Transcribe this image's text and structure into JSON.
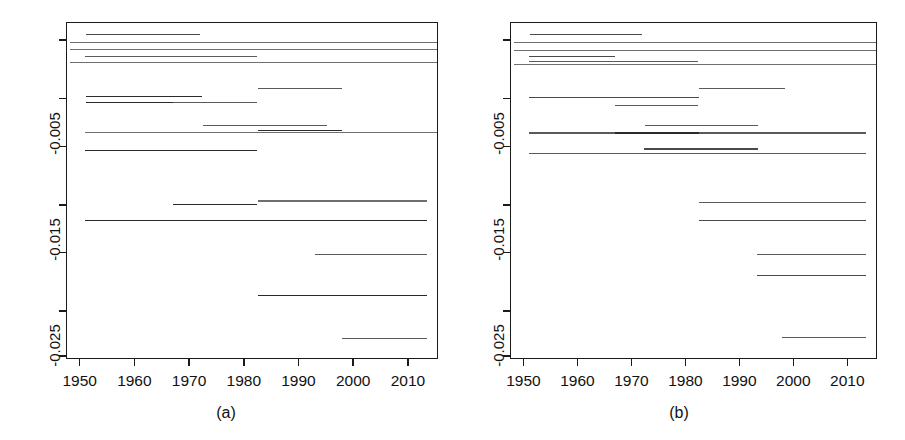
{
  "figure": {
    "width": 905,
    "height": 440,
    "background": "#ffffff",
    "line_color": "#333333",
    "axis_color": "#1a1a1a"
  },
  "panels": [
    {
      "id": "a",
      "label": "(a)",
      "plot_area": {
        "left": 66,
        "top": 22,
        "width": 372,
        "height": 337
      },
      "axes": {
        "x": {
          "min": 1947.5,
          "max": 2015.5,
          "ticks": [
            1950,
            1960,
            1970,
            1980,
            1990,
            2000,
            2010
          ],
          "ticklabels": [
            "1950",
            "1960",
            "1970",
            "1980",
            "1990",
            "2000",
            "2010"
          ]
        },
        "y": {
          "min": -0.0295,
          "max": 0.0022,
          "ticks": [
            0.0005,
            -0.005,
            -0.0095,
            -0.015,
            -0.0195,
            -0.025,
            -0.0292
          ],
          "ticklabels": [
            "",
            "-0.005",
            "",
            "-0.015",
            "",
            "-0.025",
            ""
          ],
          "labelled_ticks": [
            -0.005,
            -0.015,
            -0.025
          ]
        }
      },
      "chart_data": {
        "type": "line",
        "title": "",
        "xlabel": "",
        "ylabel": "",
        "xlim": [
          1947.5,
          2015.5
        ],
        "ylim": [
          -0.0295,
          0.0022
        ],
        "grid": false,
        "legend": "none",
        "series": [
          {
            "name": "seg1",
            "x": [
              1951.0,
              1971.8
            ],
            "y": 0.00115,
            "shade": "#4a4a4a"
          },
          {
            "name": "seg2",
            "x": [
              1948.0,
              2015.5
            ],
            "y": 0.0004,
            "shade": "#6f6f6f"
          },
          {
            "name": "seg3",
            "x": [
              1948.0,
              2015.5
            ],
            "y": -0.0003,
            "shade": "#6f6f6f"
          },
          {
            "name": "seg4",
            "x": [
              1950.8,
              1982.3
            ],
            "y": -0.00095,
            "shade": "#5a5a5a"
          },
          {
            "name": "seg5",
            "x": [
              1948.0,
              2015.5
            ],
            "y": -0.00155,
            "shade": "#6f6f6f"
          },
          {
            "name": "seg6",
            "x": [
              1982.4,
              1997.7
            ],
            "y": -0.00395,
            "shade": "#5a5a5a"
          },
          {
            "name": "seg7",
            "x": [
              1951.0,
              1972.2
            ],
            "y": -0.0047,
            "shade": "#2b2b2b"
          },
          {
            "name": "seg8",
            "x": [
              1951.0,
              1966.8
            ],
            "y": -0.0053,
            "shade": "#2b2b2b"
          },
          {
            "name": "seg9",
            "x": [
              1966.8,
              1982.2
            ],
            "y": -0.00525,
            "shade": "#5a5a5a"
          },
          {
            "name": "seg10",
            "x": [
              1972.3,
              1995.0
            ],
            "y": -0.00745,
            "shade": "#5a5a5a"
          },
          {
            "name": "seg11",
            "x": [
              1982.4,
              1997.8
            ],
            "y": -0.0079,
            "shade": "#2b2b2b"
          },
          {
            "name": "seg12",
            "x": [
              1950.8,
              2015.5
            ],
            "y": -0.0081,
            "shade": "#6f6f6f"
          },
          {
            "name": "seg13",
            "x": [
              1950.8,
              1982.3
            ],
            "y": -0.0098,
            "shade": "#2b2b2b"
          },
          {
            "name": "seg14",
            "x": [
              1966.9,
              1982.3
            ],
            "y": -0.0149,
            "shade": "#2b2b2b"
          },
          {
            "name": "seg15",
            "x": [
              1982.4,
              2013.3
            ],
            "y": -0.01455,
            "shade": "#6f6f6f"
          },
          {
            "name": "seg16",
            "x": [
              1950.8,
              2013.3
            ],
            "y": -0.0164,
            "shade": "#2b2b2b"
          },
          {
            "name": "seg17",
            "x": [
              1992.8,
              2013.3
            ],
            "y": -0.01955,
            "shade": "#5a5a5a"
          },
          {
            "name": "seg18",
            "x": [
              1982.5,
              2013.3
            ],
            "y": -0.02345,
            "shade": "#2b2b2b"
          },
          {
            "name": "seg19",
            "x": [
              1997.7,
              2013.3
            ],
            "y": -0.02745,
            "shade": "#5a5a5a"
          }
        ]
      }
    },
    {
      "id": "b",
      "label": "(b)",
      "plot_area": {
        "left": 57,
        "top": 22,
        "width": 367,
        "height": 337
      },
      "axes": {
        "x": {
          "min": 1947.5,
          "max": 2015.5,
          "ticks": [
            1950,
            1960,
            1970,
            1980,
            1990,
            2000,
            2010
          ],
          "ticklabels": [
            "1950",
            "1960",
            "1970",
            "1980",
            "1990",
            "2000",
            "2010"
          ]
        },
        "y": {
          "min": -0.0295,
          "max": 0.0022,
          "ticks": [
            0.0005,
            -0.005,
            -0.0095,
            -0.015,
            -0.0195,
            -0.025,
            -0.0292
          ],
          "ticklabels": [
            "",
            "-0.005",
            "",
            "-0.015",
            "",
            "-0.025",
            ""
          ],
          "labelled_ticks": [
            -0.005,
            -0.015,
            -0.025
          ]
        }
      },
      "chart_data": {
        "type": "line",
        "title": "",
        "xlabel": "",
        "ylabel": "",
        "xlim": [
          1947.5,
          2015.5
        ],
        "ylim": [
          -0.0295,
          0.0022
        ],
        "grid": false,
        "legend": "none",
        "series": [
          {
            "name": "seg1",
            "x": [
              1951.0,
              1971.8
            ],
            "y": 0.00115,
            "shade": "#4a4a4a"
          },
          {
            "name": "seg2",
            "x": [
              1948.0,
              2015.5
            ],
            "y": 0.0004,
            "shade": "#6f6f6f"
          },
          {
            "name": "seg3",
            "x": [
              1950.8,
              1971.9
            ],
            "y": -0.00035,
            "shade": "#2b2b2b"
          },
          {
            "name": "seg4",
            "x": [
              1948.0,
              2015.5
            ],
            "y": -0.00035,
            "shade": "#6f6f6f"
          },
          {
            "name": "seg5",
            "x": [
              1950.9,
              1966.8
            ],
            "y": -0.00095,
            "shade": "#4a4a4a"
          },
          {
            "name": "seg6",
            "x": [
              1950.9,
              1982.2
            ],
            "y": -0.0014,
            "shade": "#5a5a5a"
          },
          {
            "name": "seg7",
            "x": [
              1948.0,
              2015.5
            ],
            "y": -0.0017,
            "shade": "#6f6f6f"
          },
          {
            "name": "seg8",
            "x": [
              1982.4,
              1998.3
            ],
            "y": -0.004,
            "shade": "#5a5a5a"
          },
          {
            "name": "seg9",
            "x": [
              1950.9,
              1982.3
            ],
            "y": -0.0048,
            "shade": "#4a4a4a"
          },
          {
            "name": "seg10",
            "x": [
              1966.8,
              1982.2
            ],
            "y": -0.00555,
            "shade": "#5a5a5a"
          },
          {
            "name": "seg11",
            "x": [
              1972.3,
              1993.2
            ],
            "y": -0.00745,
            "shade": "#5a5a5a"
          },
          {
            "name": "seg12",
            "x": [
              1950.9,
              2013.3
            ],
            "y": -0.00815,
            "shade": "#5a5a5a"
          },
          {
            "name": "seg13",
            "x": [
              1966.8,
              1982.3
            ],
            "y": -0.00815,
            "shade": "#2b2b2b"
          },
          {
            "name": "seg14",
            "x": [
              1972.2,
              1993.2
            ],
            "y": -0.00965,
            "shade": "#4a4a4a"
          },
          {
            "name": "seg15",
            "x": [
              1950.9,
              2013.3
            ],
            "y": -0.0101,
            "shade": "#5a5a5a"
          },
          {
            "name": "seg16",
            "x": [
              1982.4,
              2013.3
            ],
            "y": -0.0147,
            "shade": "#5a5a5a"
          },
          {
            "name": "seg17",
            "x": [
              1982.4,
              2013.3
            ],
            "y": -0.0164,
            "shade": "#4a4a4a"
          },
          {
            "name": "seg18",
            "x": [
              1993.0,
              2013.3
            ],
            "y": -0.01955,
            "shade": "#5a5a5a"
          },
          {
            "name": "seg19",
            "x": [
              1993.0,
              2013.3
            ],
            "y": -0.02155,
            "shade": "#4a4a4a"
          },
          {
            "name": "seg20",
            "x": [
              1997.8,
              2013.3
            ],
            "y": -0.0274,
            "shade": "#5a5a5a"
          }
        ]
      }
    }
  ]
}
